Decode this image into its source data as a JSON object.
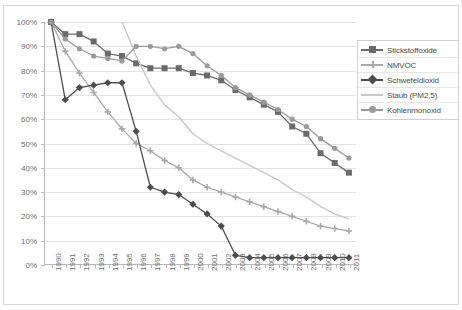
{
  "chart_data": {
    "type": "line",
    "title": "",
    "subtitle": "",
    "xlabel": "",
    "ylabel": "",
    "grid": true,
    "legend_position": "right",
    "ylim": [
      0,
      100
    ],
    "ytick_labels": [
      "100%",
      "90%",
      "80%",
      "70%",
      "60%",
      "50%",
      "40%",
      "30%",
      "20%",
      "10%",
      "0%"
    ],
    "ytick_values": [
      100,
      90,
      80,
      70,
      60,
      50,
      40,
      30,
      20,
      10,
      0
    ],
    "categories": [
      "1990",
      "1991",
      "1992",
      "1993",
      "1994",
      "1995",
      "1996",
      "1997",
      "1998",
      "1999",
      "2000",
      "2001",
      "2002",
      "2003",
      "2004",
      "2005",
      "2006",
      "2007",
      "2008",
      "2009",
      "2010",
      "2011"
    ],
    "series": [
      {
        "name": "Stickstoffoxide",
        "color": "#6b6b6b",
        "marker": "square",
        "values": [
          100,
          95,
          95,
          92,
          87,
          86,
          83,
          81,
          81,
          81,
          79,
          78,
          76,
          72,
          69,
          66,
          63,
          57,
          54,
          46,
          42,
          38
        ]
      },
      {
        "name": "NMVOC",
        "color": "#a8a8a8",
        "marker": "cross",
        "values": [
          100,
          88,
          79,
          71,
          63,
          56,
          50,
          47,
          43,
          40,
          35,
          32,
          30,
          28,
          26,
          24,
          22,
          20,
          18,
          16,
          15,
          14
        ]
      },
      {
        "name": "Schwefeldioxid",
        "color": "#4d4d4d",
        "marker": "diamond",
        "values": [
          100,
          68,
          73,
          74,
          75,
          75,
          55,
          32,
          30,
          29,
          25,
          21,
          16,
          4,
          3,
          3,
          3,
          3,
          3,
          3,
          3,
          3
        ]
      },
      {
        "name": "Staub (PM2,5)",
        "color": "#c8c8c8",
        "marker": "line",
        "values": [
          null,
          null,
          null,
          null,
          null,
          100,
          86,
          74,
          66,
          61,
          54,
          50,
          47,
          44,
          41,
          38,
          35,
          31,
          28,
          24,
          21,
          19
        ]
      },
      {
        "name": "Kohlenmonoxid",
        "color": "#9a9a9a",
        "marker": "circle",
        "values": [
          100,
          93,
          89,
          86,
          85,
          84,
          90,
          90,
          89,
          90,
          87,
          82,
          78,
          73,
          70,
          67,
          64,
          60,
          57,
          52,
          48,
          44
        ]
      }
    ]
  }
}
